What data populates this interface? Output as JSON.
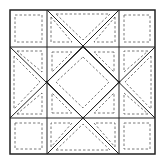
{
  "diagram": {
    "type": "quilt-block",
    "grid": "3x3",
    "colors": {
      "line": "#222222",
      "stitch": "#555555",
      "background": "#ffffff"
    },
    "outer": {
      "x": 10,
      "y": 10,
      "w": 145,
      "h": 144
    },
    "cols": [
      10,
      47,
      119,
      155
    ],
    "rows": [
      10,
      47,
      118,
      154
    ]
  }
}
